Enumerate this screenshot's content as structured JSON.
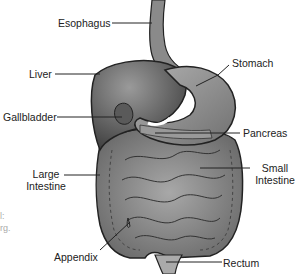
{
  "diagram": {
    "labels": {
      "esophagus": "Esophagus",
      "liver": "Liver",
      "gallbladder": "Gallbladder",
      "large_intestine_1": "Large",
      "large_intestine_2": "Intestine",
      "appendix": "Appendix",
      "stomach": "Stomach",
      "pancreas": "Pancreas",
      "small_intestine_1": "Small",
      "small_intestine_2": "Intestine",
      "rectum": "Rectum"
    },
    "cropped_text": {
      "line1": "l:",
      "line2": "rg."
    }
  }
}
